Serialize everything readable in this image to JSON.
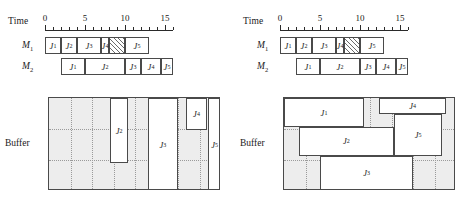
{
  "chart_data": {
    "type": "bar",
    "xlabel": "Time",
    "x_axis": {
      "min": 0,
      "max": 16,
      "tick_step": 1,
      "labeled_ticks": [
        0,
        5,
        10,
        15
      ]
    },
    "panels": [
      {
        "id": "left",
        "time_axis_label": "Time",
        "machines": [
          {
            "name": "M1",
            "label": "M",
            "sub": "1",
            "tasks": [
              {
                "label": "J",
                "sub": "1",
                "start": 0,
                "end": 2,
                "hatched": false
              },
              {
                "label": "J",
                "sub": "2",
                "start": 2,
                "end": 4,
                "hatched": false
              },
              {
                "label": "J",
                "sub": "3",
                "start": 4,
                "end": 7,
                "hatched": false
              },
              {
                "label": "J",
                "sub": "4",
                "start": 7,
                "end": 8,
                "hatched": false
              },
              {
                "label": "",
                "sub": "",
                "start": 8,
                "end": 10,
                "hatched": true
              },
              {
                "label": "J",
                "sub": "5",
                "start": 10,
                "end": 13,
                "hatched": false
              }
            ]
          },
          {
            "name": "M2",
            "label": "M",
            "sub": "2",
            "tasks": [
              {
                "label": "J",
                "sub": "1",
                "start": 2,
                "end": 5,
                "hatched": false
              },
              {
                "label": "J",
                "sub": "2",
                "start": 5,
                "end": 10,
                "hatched": false
              },
              {
                "label": "J",
                "sub": "3",
                "start": 10,
                "end": 12,
                "hatched": false
              },
              {
                "label": "J",
                "sub": "4",
                "start": 12,
                "end": 14.5,
                "hatched": false
              },
              {
                "label": "J",
                "sub": "5",
                "start": 14.5,
                "end": 16,
                "hatched": false
              }
            ]
          }
        ],
        "buffer": {
          "label": "Buffer",
          "grid_rows": 3,
          "boxes": [
            {
              "label": "J",
              "sub": "2",
              "x": 0.355,
              "y": 0.0,
              "w": 0.105,
              "h": 0.7
            },
            {
              "label": "J",
              "sub": "3",
              "x": 0.575,
              "y": 0.0,
              "w": 0.175,
              "h": 1.0
            },
            {
              "label": "J",
              "sub": "4",
              "x": 0.795,
              "y": 0.0,
              "w": 0.125,
              "h": 0.34
            },
            {
              "label": "J",
              "sub": "5",
              "x": 0.925,
              "y": 0.0,
              "w": 0.075,
              "h": 1.0
            }
          ]
        }
      },
      {
        "id": "right",
        "time_axis_label": "Time",
        "machines": [
          {
            "name": "M1",
            "label": "M",
            "sub": "1",
            "tasks": [
              {
                "label": "J",
                "sub": "1",
                "start": 0,
                "end": 2,
                "hatched": false
              },
              {
                "label": "J",
                "sub": "2",
                "start": 2,
                "end": 4,
                "hatched": false
              },
              {
                "label": "J",
                "sub": "3",
                "start": 4,
                "end": 7,
                "hatched": false
              },
              {
                "label": "J",
                "sub": "4",
                "start": 7,
                "end": 8,
                "hatched": false
              },
              {
                "label": "",
                "sub": "",
                "start": 8,
                "end": 10,
                "hatched": true
              },
              {
                "label": "J",
                "sub": "5",
                "start": 10,
                "end": 13,
                "hatched": false
              }
            ]
          },
          {
            "name": "M2",
            "label": "M",
            "sub": "2",
            "tasks": [
              {
                "label": "J",
                "sub": "1",
                "start": 2,
                "end": 5,
                "hatched": false
              },
              {
                "label": "J",
                "sub": "2",
                "start": 5,
                "end": 10,
                "hatched": false
              },
              {
                "label": "J",
                "sub": "3",
                "start": 10,
                "end": 12,
                "hatched": false
              },
              {
                "label": "J",
                "sub": "4",
                "start": 12,
                "end": 14.5,
                "hatched": false
              },
              {
                "label": "J",
                "sub": "5",
                "start": 14.5,
                "end": 16,
                "hatched": false
              }
            ]
          }
        ],
        "buffer": {
          "label": "Buffer",
          "grid_rows": 3,
          "boxes": [
            {
              "label": "J",
              "sub": "1",
              "x": 0.0,
              "y": 0.0,
              "w": 0.465,
              "h": 0.315
            },
            {
              "label": "J",
              "sub": "4",
              "x": 0.555,
              "y": 0.0,
              "w": 0.385,
              "h": 0.175
            },
            {
              "label": "J",
              "sub": "2",
              "x": 0.085,
              "y": 0.315,
              "w": 0.555,
              "h": 0.305
            },
            {
              "label": "J",
              "sub": "5",
              "x": 0.64,
              "y": 0.175,
              "w": 0.28,
              "h": 0.445
            },
            {
              "label": "J",
              "sub": "3",
              "x": 0.21,
              "y": 0.62,
              "w": 0.54,
              "h": 0.38
            }
          ]
        }
      }
    ]
  }
}
